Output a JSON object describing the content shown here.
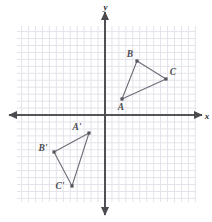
{
  "figure": {
    "title": "",
    "background_color": "#ffffff",
    "axis_color": "#4a4a4f",
    "grid_color": "#e3e3ea",
    "grid_major_color": "#d7d7e0",
    "shape_color": "#6e6e78",
    "label_color": "#4b4b50"
  },
  "axes": {
    "x_label": "x",
    "y_label": "y",
    "origin_px": {
      "x": 105,
      "y": 115
    },
    "unit_px": 6.95,
    "grid_bounds_px": {
      "left": 17,
      "top": 26,
      "right": 196,
      "bottom": 202
    },
    "x_range": [
      -12.7,
      13.1
    ],
    "y_range": [
      -12.5,
      12.8
    ],
    "grid": true,
    "tick_labels": []
  },
  "chart_data": {
    "type": "scatter",
    "title": "",
    "xlabel": "x",
    "ylabel": "y",
    "xlim": [
      -12.7,
      13.1
    ],
    "ylim": [
      -12.5,
      12.8
    ],
    "grid": true,
    "legend": "none",
    "series": [
      {
        "name": "Triangle ABC",
        "closed": true,
        "points": [
          {
            "label": "A",
            "x_px": 122,
            "y_px": 99,
            "x": 2.4,
            "y": 2.3,
            "label_dx": -1,
            "label_dy": 11
          },
          {
            "label": "B",
            "x_px": 137,
            "y_px": 61,
            "x": 4.6,
            "y": 7.8,
            "label_dx": -7,
            "label_dy": -4
          },
          {
            "label": "C",
            "x_px": 166,
            "y_px": 79,
            "x": 8.8,
            "y": 5.2,
            "label_dx": 7,
            "label_dy": -4
          }
        ]
      },
      {
        "name": "Triangle A'B'C'",
        "closed": true,
        "points": [
          {
            "label": "A'",
            "x_px": 89,
            "y_px": 133,
            "x": -2.3,
            "y": -2.6,
            "label_dx": -12,
            "label_dy": -3
          },
          {
            "label": "B'",
            "x_px": 54,
            "y_px": 152,
            "x": -7.3,
            "y": -5.3,
            "label_dx": -11,
            "label_dy": -1
          },
          {
            "label": "C'",
            "x_px": 72,
            "y_px": 186,
            "x": -4.7,
            "y": -10.2,
            "label_dx": -12,
            "label_dy": 3
          }
        ]
      }
    ]
  }
}
